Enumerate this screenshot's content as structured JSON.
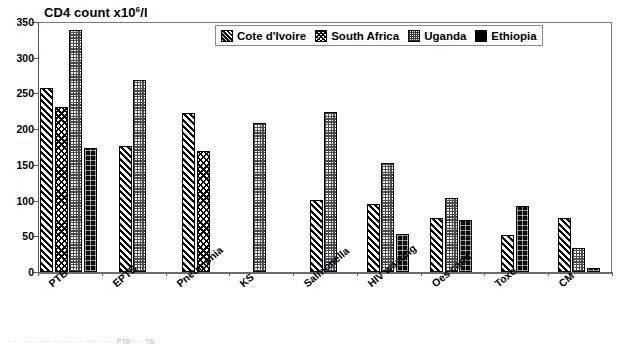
{
  "chart": {
    "title_main": "CD4 count x10",
    "title_sup": "6",
    "title_tail": "/l",
    "title_full": "CD4 count x10^6/l"
  },
  "legend": {
    "position": "top-center-inside",
    "items": [
      {
        "label": "Cote d'Ivoire",
        "key": "ci",
        "swatch": "diagonal-hatch-swatch"
      },
      {
        "label": "South Africa",
        "key": "sa",
        "swatch": "crosshatch-swatch"
      },
      {
        "label": "Uganda",
        "key": "ug",
        "swatch": "checker-swatch"
      },
      {
        "label": "Ethiopia",
        "key": "et",
        "swatch": "solid-black-swatch"
      }
    ]
  },
  "yaxis": {
    "ticks": [
      "0",
      "50",
      "100",
      "150",
      "200",
      "250",
      "300",
      "350"
    ]
  },
  "caption": {
    "text": "· ··· ·· ···· · ··· ·· ··· ···· ·· ···· · ·· ···  PTB   ··  ··  TB"
  },
  "chart_data": {
    "type": "bar",
    "xlabel": "",
    "ylabel": "CD4 count x10^6/l",
    "ylim": [
      0,
      350
    ],
    "ytick_step": 50,
    "grid": false,
    "legend_position": "top-center",
    "categories": [
      "PTB",
      "EPTB",
      "Pneumonia",
      "KS",
      "Salmonella",
      "HIV wasting",
      "Oes cand",
      "Toxo",
      "CM"
    ],
    "series": [
      {
        "name": "Cote d'Ivoire",
        "values": [
          257,
          176,
          222,
          null,
          101,
          95,
          76,
          52,
          76
        ]
      },
      {
        "name": "South Africa",
        "values": [
          231,
          null,
          170,
          null,
          null,
          null,
          null,
          null,
          null
        ]
      },
      {
        "name": "Uganda",
        "values": [
          339,
          269,
          null,
          209,
          224,
          153,
          104,
          null,
          33
        ]
      },
      {
        "name": "Ethiopia",
        "values": [
          174,
          null,
          null,
          null,
          null,
          53,
          73,
          93,
          5
        ]
      }
    ]
  }
}
